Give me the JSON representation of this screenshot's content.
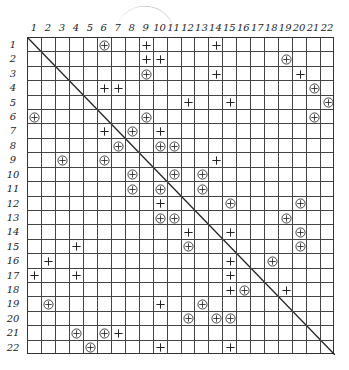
{
  "figure": {
    "size": 22,
    "column_labels": [
      "1",
      "2",
      "3",
      "4",
      "5",
      "6",
      "7",
      "8",
      "9",
      "10",
      "11",
      "12",
      "13",
      "14",
      "15",
      "16",
      "17",
      "18",
      "19",
      "20",
      "21",
      "22"
    ],
    "row_labels": [
      "1",
      "2",
      "3",
      "4",
      "5",
      "6",
      "7",
      "8",
      "9",
      "10",
      "11",
      "12",
      "13",
      "14",
      "15",
      "16",
      "17",
      "18",
      "19",
      "20",
      "21",
      "22"
    ],
    "diagonal": "main",
    "legend_symbols": {
      "plus": "+",
      "circled_plus": "⊕"
    },
    "marks": [
      {
        "row": 1,
        "col": 6,
        "type": "circled_plus"
      },
      {
        "row": 1,
        "col": 9,
        "type": "plus"
      },
      {
        "row": 1,
        "col": 14,
        "type": "plus"
      },
      {
        "row": 2,
        "col": 9,
        "type": "plus"
      },
      {
        "row": 2,
        "col": 10,
        "type": "plus"
      },
      {
        "row": 2,
        "col": 19,
        "type": "circled_plus"
      },
      {
        "row": 3,
        "col": 9,
        "type": "circled_plus"
      },
      {
        "row": 3,
        "col": 14,
        "type": "plus"
      },
      {
        "row": 3,
        "col": 20,
        "type": "plus"
      },
      {
        "row": 4,
        "col": 6,
        "type": "plus"
      },
      {
        "row": 4,
        "col": 7,
        "type": "plus"
      },
      {
        "row": 4,
        "col": 21,
        "type": "circled_plus"
      },
      {
        "row": 5,
        "col": 12,
        "type": "plus"
      },
      {
        "row": 5,
        "col": 15,
        "type": "plus"
      },
      {
        "row": 5,
        "col": 22,
        "type": "circled_plus"
      },
      {
        "row": 6,
        "col": 1,
        "type": "circled_plus"
      },
      {
        "row": 6,
        "col": 9,
        "type": "circled_plus"
      },
      {
        "row": 6,
        "col": 21,
        "type": "circled_plus"
      },
      {
        "row": 7,
        "col": 6,
        "type": "plus"
      },
      {
        "row": 7,
        "col": 8,
        "type": "circled_plus"
      },
      {
        "row": 7,
        "col": 10,
        "type": "plus"
      },
      {
        "row": 8,
        "col": 7,
        "type": "circled_plus"
      },
      {
        "row": 8,
        "col": 10,
        "type": "circled_plus"
      },
      {
        "row": 8,
        "col": 11,
        "type": "circled_plus"
      },
      {
        "row": 9,
        "col": 3,
        "type": "circled_plus"
      },
      {
        "row": 9,
        "col": 6,
        "type": "circled_plus"
      },
      {
        "row": 9,
        "col": 14,
        "type": "plus"
      },
      {
        "row": 10,
        "col": 8,
        "type": "circled_plus"
      },
      {
        "row": 10,
        "col": 11,
        "type": "circled_plus"
      },
      {
        "row": 10,
        "col": 13,
        "type": "circled_plus"
      },
      {
        "row": 11,
        "col": 8,
        "type": "circled_plus"
      },
      {
        "row": 11,
        "col": 10,
        "type": "circled_plus"
      },
      {
        "row": 11,
        "col": 13,
        "type": "circled_plus"
      },
      {
        "row": 12,
        "col": 10,
        "type": "plus"
      },
      {
        "row": 12,
        "col": 15,
        "type": "circled_plus"
      },
      {
        "row": 12,
        "col": 20,
        "type": "circled_plus"
      },
      {
        "row": 13,
        "col": 10,
        "type": "circled_plus"
      },
      {
        "row": 13,
        "col": 11,
        "type": "circled_plus"
      },
      {
        "row": 13,
        "col": 19,
        "type": "circled_plus"
      },
      {
        "row": 14,
        "col": 12,
        "type": "plus"
      },
      {
        "row": 14,
        "col": 15,
        "type": "plus"
      },
      {
        "row": 14,
        "col": 20,
        "type": "circled_plus"
      },
      {
        "row": 15,
        "col": 4,
        "type": "plus"
      },
      {
        "row": 15,
        "col": 12,
        "type": "circled_plus"
      },
      {
        "row": 15,
        "col": 20,
        "type": "circled_plus"
      },
      {
        "row": 16,
        "col": 2,
        "type": "plus"
      },
      {
        "row": 16,
        "col": 15,
        "type": "plus"
      },
      {
        "row": 16,
        "col": 18,
        "type": "circled_plus"
      },
      {
        "row": 17,
        "col": 1,
        "type": "plus"
      },
      {
        "row": 17,
        "col": 4,
        "type": "plus"
      },
      {
        "row": 17,
        "col": 15,
        "type": "plus"
      },
      {
        "row": 18,
        "col": 15,
        "type": "plus"
      },
      {
        "row": 18,
        "col": 16,
        "type": "circled_plus"
      },
      {
        "row": 18,
        "col": 19,
        "type": "plus"
      },
      {
        "row": 19,
        "col": 2,
        "type": "circled_plus"
      },
      {
        "row": 19,
        "col": 10,
        "type": "plus"
      },
      {
        "row": 19,
        "col": 13,
        "type": "circled_plus"
      },
      {
        "row": 20,
        "col": 12,
        "type": "circled_plus"
      },
      {
        "row": 20,
        "col": 14,
        "type": "circled_plus"
      },
      {
        "row": 20,
        "col": 15,
        "type": "circled_plus"
      },
      {
        "row": 21,
        "col": 4,
        "type": "circled_plus"
      },
      {
        "row": 21,
        "col": 6,
        "type": "circled_plus"
      },
      {
        "row": 21,
        "col": 7,
        "type": "plus"
      },
      {
        "row": 22,
        "col": 5,
        "type": "circled_plus"
      },
      {
        "row": 22,
        "col": 10,
        "type": "plus"
      },
      {
        "row": 22,
        "col": 15,
        "type": "plus"
      }
    ]
  }
}
